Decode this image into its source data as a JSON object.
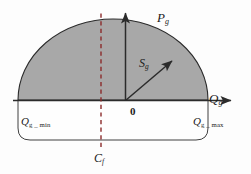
{
  "figure": {
    "kind": "generator-capability-curve",
    "background_color": "#fdfdfd",
    "fill_color": "#a8a8a8",
    "line_color": "#2b2b2b",
    "dashed_line_color": "#8c2b2b"
  },
  "axes": {
    "horizontal": {
      "name": "reactive-power-axis",
      "label_main": "Q",
      "label_sub": "g"
    },
    "vertical": {
      "name": "active-power-axis",
      "label_main": "P",
      "label_sub": "g"
    },
    "origin_label": "0"
  },
  "vector": {
    "name": "apparent-power-vector",
    "label_main": "S",
    "label_sub": "g"
  },
  "limits": {
    "min": {
      "label_main": "Q",
      "label_sub": "g _ min"
    },
    "max": {
      "label_main": "Q",
      "label_sub": "g _ max"
    }
  },
  "reference_line": {
    "name": "fixed-capacitor-line",
    "label_main": "C",
    "label_sub": "f"
  }
}
